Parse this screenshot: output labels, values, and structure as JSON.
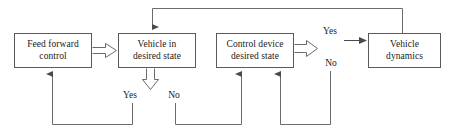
{
  "diagram": {
    "type": "flowchart",
    "canvas": {
      "width": 451,
      "height": 135,
      "background": "#ffffff"
    },
    "style": {
      "box_border_color": "#5a5a5a",
      "line_color": "#6b6b6b",
      "text_color": "#1a1a1a"
    },
    "nodes": [
      {
        "id": "feed-forward-control",
        "line1": "Feed forward",
        "line2": "control",
        "x": 14,
        "y": 33,
        "width": 78,
        "height": 35
      },
      {
        "id": "vehicle-in-desired-state",
        "line1": "Vehicle in",
        "line2": "desired state",
        "x": 118,
        "y": 33,
        "width": 78,
        "height": 35
      },
      {
        "id": "control-device-desired-state",
        "line1": "Control device",
        "line2": "desired state",
        "x": 216,
        "y": 33,
        "width": 78,
        "height": 35
      },
      {
        "id": "vehicle-dynamics",
        "line1": "Vehicle",
        "line2": "dynamics",
        "x": 368,
        "y": 33,
        "width": 73,
        "height": 35
      }
    ],
    "edge_labels": [
      {
        "id": "yes-vehicle-state",
        "text": "Yes",
        "x": 118,
        "y": 90,
        "width": 24
      },
      {
        "id": "no-vehicle-state",
        "text": "No",
        "x": 163,
        "y": 90,
        "width": 22
      },
      {
        "id": "yes-control-device",
        "text": "Yes",
        "x": 318,
        "y": 26,
        "width": 24
      },
      {
        "id": "no-control-device",
        "text": "No",
        "x": 320,
        "y": 58,
        "width": 22
      }
    ]
  }
}
